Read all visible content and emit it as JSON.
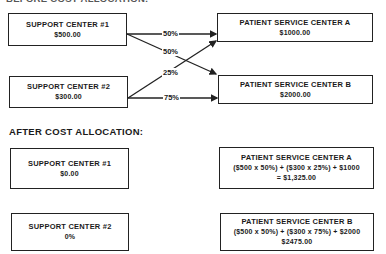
{
  "before": {
    "title": "BEFORE COST ALLOCATION:",
    "support_center_1": {
      "name": "SUPPORT CENTER #1",
      "amount": "$500.00"
    },
    "support_center_2": {
      "name": "SUPPORT CENTER #2",
      "amount": "$300.00"
    },
    "patient_center_a": {
      "name": "PATIENT SERVICE CENTER A",
      "amount": "$1000.00"
    },
    "patient_center_b": {
      "name": "PATIENT SERVICE CENTER B",
      "amount": "$2000.00"
    },
    "allocations": {
      "sc1_to_a": "50%",
      "sc1_to_b": "50%",
      "sc2_to_a": "25%",
      "sc2_to_b": "75%"
    }
  },
  "after": {
    "title": "AFTER COST ALLOCATION:",
    "support_center_1": {
      "name": "SUPPORT CENTER #1",
      "amount": "$0.00"
    },
    "support_center_2": {
      "name": "SUPPORT CENTER #2",
      "amount": "0%"
    },
    "patient_center_a": {
      "name": "PATIENT SERVICE CENTER A",
      "formula": "($500 x 50%) + ($300 x 25%) + $1000",
      "result": "= $1,325.00"
    },
    "patient_center_b": {
      "name": "PATIENT SERVICE CENTER B",
      "formula": "($500 x 50%) + ($300 x 75%) + $2000",
      "result": "$2475.00"
    }
  }
}
